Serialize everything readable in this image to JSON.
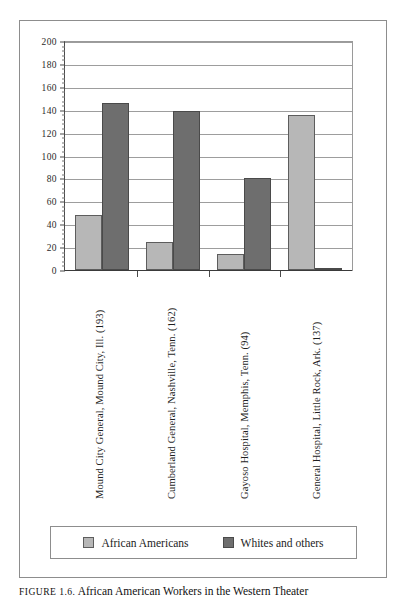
{
  "figure": {
    "caption_prefix": "FIGURE 1.6.",
    "caption_text": " African American Workers in the Western Theater"
  },
  "legend": {
    "position": "bottom",
    "items": [
      {
        "label": "African Americans",
        "color": "#b7b7b7",
        "swatch_name": "legend-swatch-african-americans"
      },
      {
        "label": "Whites and others",
        "color": "#6e6e6e",
        "swatch_name": "legend-swatch-whites-and-others"
      }
    ]
  },
  "yaxis": {
    "ticks": [
      "0",
      "20",
      "40",
      "60",
      "80",
      "100",
      "120",
      "140",
      "160",
      "180",
      "200"
    ]
  },
  "chart_data": {
    "type": "bar",
    "title": "African American Workers in the Western Theater",
    "xlabel": "",
    "ylabel": "",
    "ylim": [
      0,
      200
    ],
    "ytick_step": 20,
    "grid": true,
    "legend_position": "bottom",
    "categories": [
      "Mound City General, Mound City, Ill. (193)",
      "Cumberland General, Nashville, Tenn. (162)",
      "Gayoso Hospital, Memphis, Tenn. (94)",
      "General Hospital, Little Rock, Ark. (137)"
    ],
    "series": [
      {
        "name": "African Americans",
        "color": "#b7b7b7",
        "values": [
          48,
          24,
          14,
          135
        ]
      },
      {
        "name": "Whites and others",
        "color": "#6e6e6e",
        "values": [
          145,
          138,
          80,
          2
        ]
      }
    ]
  }
}
